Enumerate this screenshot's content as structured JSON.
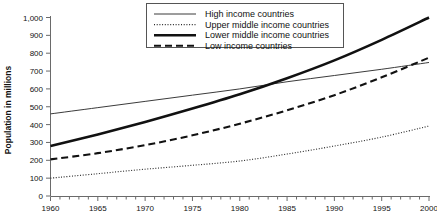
{
  "chart_data": {
    "type": "line",
    "title": "",
    "xlabel": "",
    "ylabel": "Population in millions",
    "xlim": [
      1960,
      2000
    ],
    "ylim": [
      0,
      1000
    ],
    "grid": false,
    "legend_position": "top-center",
    "x_tick_labels": [
      "1960",
      "1965",
      "1970",
      "1975",
      "1980",
      "1985",
      "1990",
      "1995",
      "2000"
    ],
    "x_tick_values": [
      1960,
      1965,
      1970,
      1975,
      1980,
      1985,
      1990,
      1995,
      2000
    ],
    "x_minor_tick_step": 1,
    "y_tick_labels": [
      "0",
      "100",
      "200",
      "300",
      "400",
      "500",
      "600",
      "700",
      "800",
      "900",
      "1,000"
    ],
    "y_tick_values": [
      0,
      100,
      200,
      300,
      400,
      500,
      600,
      700,
      800,
      900,
      1000
    ],
    "x": [
      1960,
      1965,
      1970,
      1975,
      1980,
      1985,
      1990,
      1995,
      2000
    ],
    "series": [
      {
        "name": "High income countries",
        "style": "thin-solid",
        "color": "#3b3b3b",
        "values": [
          460,
          495,
          530,
          565,
          600,
          640,
          675,
          710,
          748
        ]
      },
      {
        "name": "Upper middle income countries",
        "style": "dotted",
        "color": "#2a2a2a",
        "values": [
          100,
          125,
          150,
          172,
          196,
          235,
          280,
          330,
          392
        ]
      },
      {
        "name": "Lower middle income countries",
        "style": "thick-solid",
        "color": "#111111",
        "values": [
          280,
          345,
          415,
          490,
          570,
          660,
          760,
          875,
          1000
        ]
      },
      {
        "name": "Low income countries",
        "style": "thick-dashed",
        "color": "#111111",
        "values": [
          205,
          240,
          285,
          340,
          405,
          480,
          565,
          665,
          775
        ]
      }
    ]
  },
  "legend": {
    "items": [
      {
        "label": "High income countries",
        "style": "thin-solid"
      },
      {
        "label": "Upper middle income countries",
        "style": "dotted"
      },
      {
        "label": "Lower middle income countries",
        "style": "thick-solid"
      },
      {
        "label": "Low income countries",
        "style": "thick-dashed"
      }
    ]
  }
}
